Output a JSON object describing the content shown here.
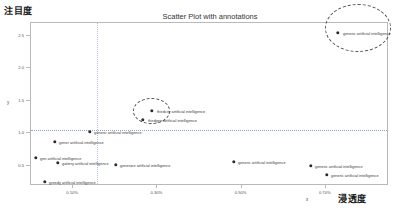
{
  "chart_data": {
    "type": "scatter",
    "title": "Scatter Plot with annotations",
    "xlabel": "x",
    "ylabel": "y",
    "xlabel_outer": "浸透度",
    "ylabel_outer": "注目度",
    "grid": false,
    "legend": "none",
    "xlim": [
      0.0,
      0.0085
    ],
    "ylim": [
      0.2,
      2.7
    ],
    "xticks": [
      {
        "value": 0.001,
        "label": "0.10%"
      },
      {
        "value": 0.003,
        "label": "0.30%"
      },
      {
        "value": 0.005,
        "label": "0.50%"
      },
      {
        "value": 0.007,
        "label": "0.70%"
      }
    ],
    "yticks": [
      {
        "value": 0.5,
        "label": "0.5"
      },
      {
        "value": 1.0,
        "label": "1.0"
      },
      {
        "value": 1.5,
        "label": "1.5"
      },
      {
        "value": 2.0,
        "label": "2.0"
      },
      {
        "value": 2.5,
        "label": "2.5"
      }
    ],
    "reference_lines": [
      {
        "orientation": "horizontal",
        "value": 1.05,
        "style": "dotted"
      },
      {
        "orientation": "vertical",
        "value": 0.0019,
        "style": "dotted"
      }
    ],
    "annotation_shapes": [
      {
        "shape": "ellipse",
        "name": "top-right-cluster",
        "style": "dashed"
      },
      {
        "shape": "ellipse",
        "name": "middle-cluster",
        "style": "dashed"
      }
    ],
    "points": [
      {
        "x": 0.00755,
        "y": 2.6,
        "label": "generic artificial intelligence",
        "px": 338,
        "py": 33,
        "lx": 343,
        "ly": 33
      },
      {
        "x": 0.0025,
        "y": 1.26,
        "label": "thirdcity artificial intelligence",
        "px": 152,
        "py": 111,
        "lx": 157,
        "ly": 111
      },
      {
        "x": 0.0021,
        "y": 1.17,
        "label": "thirdgen artificial intelligence",
        "px": 143,
        "py": 120,
        "lx": 148,
        "ly": 120
      },
      {
        "x": 0.00165,
        "y": 1.02,
        "label": "generic artificial intelligence",
        "px": 90,
        "py": 132,
        "lx": 94,
        "ly": 132
      },
      {
        "x": 0.00075,
        "y": 0.89,
        "label": "gener artificial intelligence",
        "px": 55,
        "py": 142,
        "lx": 59,
        "ly": 142
      },
      {
        "x": 0.00035,
        "y": 0.7,
        "label": "gen artificial intelligence",
        "px": 36,
        "py": 158,
        "lx": 40,
        "ly": 158
      },
      {
        "x": 0.00085,
        "y": 0.66,
        "label": "gattery artificial intelligence",
        "px": 58,
        "py": 163,
        "lx": 62,
        "ly": 163
      },
      {
        "x": 0.00195,
        "y": 0.64,
        "label": "generare artificial intelligence",
        "px": 116,
        "py": 165,
        "lx": 120,
        "ly": 165
      },
      {
        "x": 0.0043,
        "y": 0.67,
        "label": "generic artificial intelligence",
        "px": 234,
        "py": 162,
        "lx": 238,
        "ly": 162
      },
      {
        "x": 0.006,
        "y": 0.63,
        "label": "generic artificial intelligence",
        "px": 311,
        "py": 166,
        "lx": 315,
        "ly": 166
      },
      {
        "x": 0.0064,
        "y": 0.54,
        "label": "generic artificial intelligence",
        "px": 327,
        "py": 175,
        "lx": 331,
        "ly": 175
      },
      {
        "x": 0.0006,
        "y": 0.45,
        "label": "greedy artificial intelligence",
        "px": 45,
        "py": 182,
        "lx": 49,
        "ly": 182
      }
    ]
  },
  "axes": {
    "title": "Scatter Plot with annotations",
    "x_letter": "x",
    "y_letter": "y",
    "x_outer": "浸透度",
    "y_outer": "注目度"
  }
}
